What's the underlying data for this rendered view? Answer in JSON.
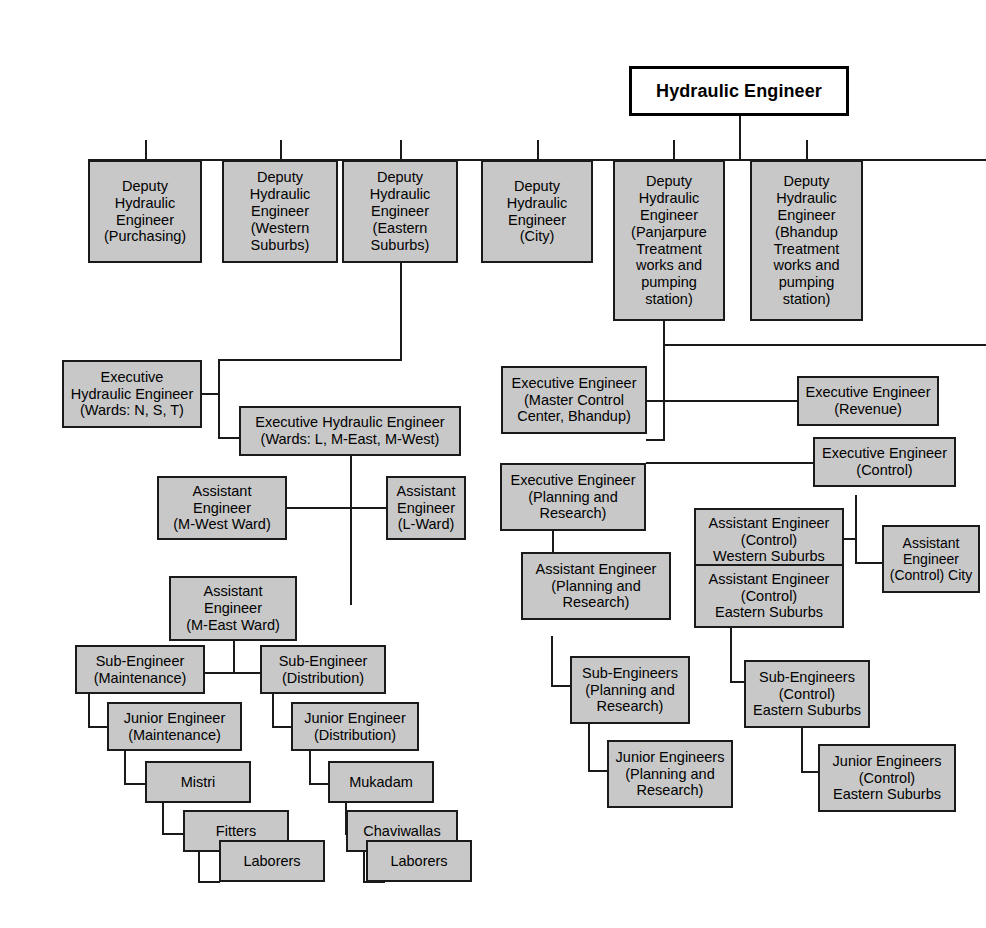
{
  "chart": {
    "type": "org-chart",
    "box_fill_color": "#c8c8c8",
    "box_border_color": "#1a1a1a",
    "root_fill_color": "#ffffff",
    "background_color": "#ffffff"
  },
  "root": {
    "label": "Hydraulic Engineer"
  },
  "deputies": [
    {
      "label": "Deputy\nHydraulic\nEngineer\n(Purchasing)"
    },
    {
      "label": "Deputy\nHydraulic\nEngineer\n(Western\nSuburbs)"
    },
    {
      "label": "Deputy\nHydraulic\nEngineer\n(Eastern\nSuburbs)"
    },
    {
      "label": "Deputy\nHydraulic\nEngineer\n(City)"
    },
    {
      "label": "Deputy\nHydraulic\nEngineer\n(Panjarpure\nTreatment\nworks and\npumping\nstation)"
    },
    {
      "label": "Deputy\nHydraulic\nEngineer\n(Bhandup\nTreatment\nworks and\npumping\nstation)"
    }
  ],
  "eastern_branch": {
    "exec_wards_nst": "Executive\nHydraulic Engineer\n(Wards: N, S, T)",
    "exec_wards_lmm": "Executive Hydraulic Engineer\n(Wards: L, M-East, M-West)",
    "asst_mwest": "Assistant\nEngineer\n(M-West Ward)",
    "asst_lward": "Assistant\nEngineer\n(L-Ward)",
    "asst_meast": "Assistant\nEngineer\n(M-East Ward)",
    "sub_maintenance": "Sub-Engineer\n(Maintenance)",
    "sub_distribution": "Sub-Engineer\n(Distribution)",
    "junior_maintenance": "Junior Engineer\n(Maintenance)",
    "junior_distribution": "Junior Engineer\n(Distribution)",
    "mistri": "Mistri",
    "fitters": "Fitters",
    "laborers_maintenance": "Laborers",
    "mukadam": "Mukadam",
    "chaviwallas": "Chaviwallas",
    "laborers_distribution": "Laborers"
  },
  "bhandup_branch": {
    "exec_master_control": "Executive Engineer\n(Master Control\nCenter, Bhandup)",
    "exec_revenue": "Executive Engineer\n(Revenue)",
    "exec_control": "Executive Engineer\n(Control)",
    "exec_planning": "Executive Engineer\n(Planning and\nResearch)",
    "asst_planning": "Assistant Engineer\n(Planning and\nResearch)",
    "sub_planning": "Sub-Engineers\n(Planning and\nResearch)",
    "junior_planning": "Junior Engineers\n(Planning and\nResearch)",
    "asst_control_western": "Assistant Engineer\n(Control)\nWestern Suburbs",
    "asst_control_city": "Assistant\nEngineer\n(Control) City",
    "asst_control_eastern": "Assistant Engineer\n(Control)\nEastern Suburbs",
    "sub_control_eastern": "Sub-Engineers\n(Control)\nEastern Suburbs",
    "junior_control_eastern": "Junior Engineers\n(Control)\nEastern Suburbs"
  }
}
